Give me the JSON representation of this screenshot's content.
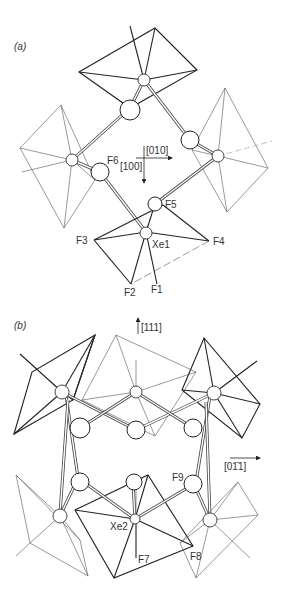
{
  "figure": {
    "panels": [
      {
        "id": "a",
        "label": "(a)",
        "atom_labels": {
          "F6": "F6",
          "F5": "F5",
          "F3": "F3",
          "F4": "F4",
          "Xe1": "Xe1",
          "F2": "F2",
          "F1": "F1"
        },
        "axes": {
          "horizontal": "[010]",
          "vertical": "[100]"
        }
      },
      {
        "id": "b",
        "label": "(b)",
        "atom_labels": {
          "F9": "F9",
          "Xe2": "Xe2",
          "F7": "F7",
          "F8": "F8"
        },
        "axes": {
          "vertical": "[111]",
          "horizontal": "[01̄1]"
        }
      }
    ]
  },
  "colors": {
    "line": "#222222",
    "text": "#333333",
    "background": "#ffffff"
  }
}
